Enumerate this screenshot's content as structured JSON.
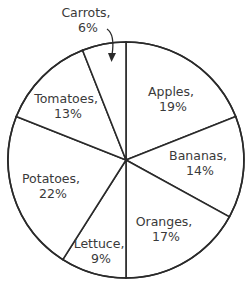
{
  "chart_data": {
    "type": "pie",
    "title": "",
    "start_angle": "12 o'clock",
    "direction": "clockwise",
    "categories": [
      "Apples",
      "Bananas",
      "Oranges",
      "Lettuce",
      "Potatoes",
      "Tomatoes",
      "Carrots"
    ],
    "values": [
      19,
      14,
      17,
      9,
      22,
      13,
      6
    ],
    "unit": "%",
    "labels": [
      {
        "name": "Apples",
        "pct": "19%"
      },
      {
        "name": "Bananas",
        "pct": "14%"
      },
      {
        "name": "Oranges",
        "pct": "17%"
      },
      {
        "name": "Lettuce",
        "pct": "9%"
      },
      {
        "name": "Potatoes",
        "pct": "22%"
      },
      {
        "name": "Tomatoes",
        "pct": "13%"
      },
      {
        "name": "Carrots",
        "pct": "6%"
      }
    ],
    "annotations": [
      "Carrots label placed outside pie with arrow pointing into its slice"
    ],
    "legend": "none",
    "colors": {
      "fill": "#ffffff",
      "stroke": "#2a2a2a",
      "text": "#3a3a3a"
    }
  },
  "layout": {
    "cx": 126,
    "cy": 160,
    "r": 118,
    "label_positions": [
      {
        "x": 173,
        "y": 96
      },
      {
        "x": 200,
        "y": 160
      },
      {
        "x": 166,
        "y": 226
      },
      {
        "x": 101,
        "y": 248
      },
      {
        "x": 53,
        "y": 183
      },
      {
        "x": 68,
        "y": 103
      },
      {
        "x": 88,
        "y": 17
      }
    ]
  }
}
